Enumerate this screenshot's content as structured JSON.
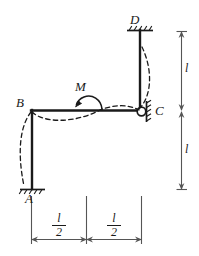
{
  "figure": {
    "type": "structural-frame-diagram",
    "stroke_color": "#1a1a1a",
    "background_color": "#ffffff",
    "members": [
      {
        "name": "column-AB",
        "from": "A",
        "to": "B",
        "orientation": "vertical"
      },
      {
        "name": "beam-BC",
        "from": "B",
        "to": "C",
        "orientation": "horizontal"
      },
      {
        "name": "column-CD",
        "from": "C",
        "to": "D",
        "orientation": "vertical"
      }
    ],
    "nodes": [
      {
        "id": "A",
        "label": "A",
        "support": "fixed-base",
        "hatch": "below"
      },
      {
        "id": "B",
        "label": "B",
        "support": "rigid-joint",
        "hatch": "none"
      },
      {
        "id": "C",
        "label": "C",
        "support": "pinned-wall",
        "hatch": "right"
      },
      {
        "id": "D",
        "label": "D",
        "support": "fixed-top",
        "hatch": "above"
      }
    ],
    "load": {
      "name": "applied-moment",
      "label": "M",
      "sense": "counterclockwise",
      "location": "midspan of beam BC"
    },
    "dimensions": {
      "vertical": [
        {
          "name": "dim-upper-height",
          "label": "l",
          "span": "C to D"
        },
        {
          "name": "dim-lower-height",
          "label": "l",
          "span": "A to C"
        }
      ],
      "horizontal": [
        {
          "name": "dim-left-half-span",
          "numerator": "l",
          "denominator": "2"
        },
        {
          "name": "dim-right-half-span",
          "numerator": "l",
          "denominator": "2"
        }
      ]
    },
    "deflected_shape": {
      "name": "deflected-shape",
      "style": "dashed",
      "curves": [
        "column-AB bows left",
        "beam-BC sags then rises",
        "column-CD bows right"
      ]
    }
  }
}
